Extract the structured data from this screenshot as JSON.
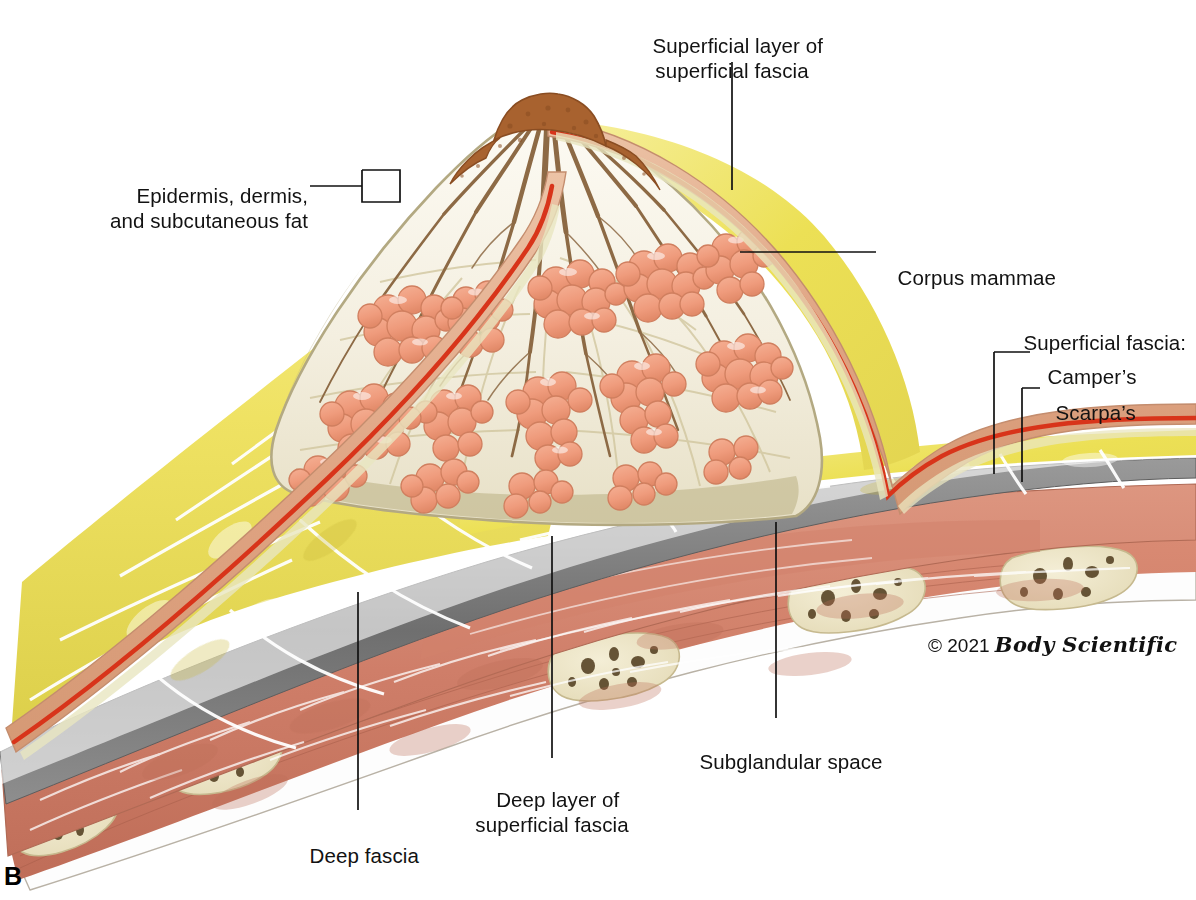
{
  "figure": {
    "panel_label": "B",
    "copyright_symbol": "© 2021",
    "copyright_brand": "Body Scientific"
  },
  "labels": {
    "superficial_layer": "Superficial layer of\nsuperficial fascia",
    "epidermis": "Epidermis, dermis,\nand subcutaneous fat",
    "corpus_mammae": "Corpus mammae",
    "superficial_fascia_group": "Superficial fascia:",
    "campers": "Camper’s",
    "scarpas": "Scarpa’s",
    "subglandular_space": "Subglandular space",
    "deep_layer": "Deep layer of\nsuperficial fascia",
    "deep_fascia": "Deep fascia"
  },
  "colors": {
    "skin": "#e0a98a",
    "skin_light": "#f0cdb6",
    "dermis_red": "#d8341a",
    "fat_yellow": "#f0e46a",
    "fat_deep": "#ded34f",
    "stroma": "#f7f3ea",
    "stroma_olive": "#b9b083",
    "lobule": "#ef9c7d",
    "lobule_dark": "#dd8260",
    "duct_brown": "#8d6a45",
    "nipple": "#a8622f",
    "deep_fascia_gray": "#7d7d7d",
    "muscle": "#d4826e",
    "muscle_dark": "#b56450",
    "bone": "#ece3c4",
    "marrow": "#5a4024",
    "leader": "#111111"
  }
}
